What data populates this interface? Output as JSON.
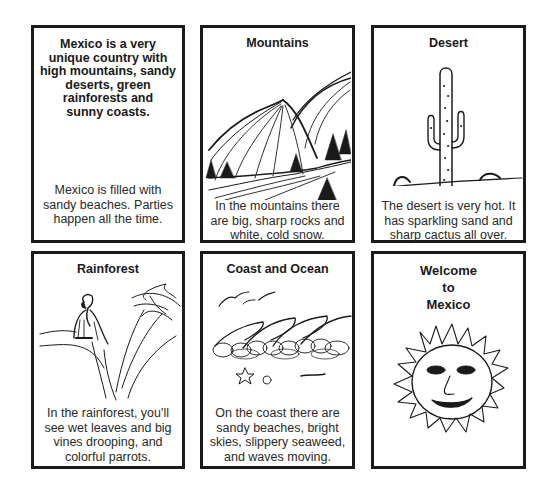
{
  "cards": [
    {
      "title": "Mexico is a very unique country with high mountains, sandy deserts, green rainforests and sunny coasts.",
      "title_lines": [
        "Mexico is a very",
        "unique country with",
        "high mountains, sandy",
        "deserts, green",
        "rainforests and",
        "sunny coasts."
      ],
      "text_lines": [
        "Mexico is filled with",
        "sandy beaches. Parties",
        "happen all the time."
      ],
      "illustration": "none"
    },
    {
      "title": "Mountains",
      "text_lines": [
        "In the mountains there",
        "are big, sharp rocks and",
        "white, cold snow."
      ],
      "illustration": "mountains-with-pine-trees"
    },
    {
      "title": "Desert",
      "text_lines": [
        "The desert is very hot. It",
        "has sparkling sand and",
        "sharp cactus all over."
      ],
      "illustration": "saguaro-cactus"
    },
    {
      "title": "Rainforest",
      "text_lines": [
        "In the rainforest, you'll",
        "see wet leaves and big",
        "vines drooping, and",
        "colorful parrots."
      ],
      "illustration": "parrot-on-branch"
    },
    {
      "title": "Coast and Ocean",
      "text_lines": [
        "On the coast there are",
        "sandy beaches, bright",
        "skies, slippery seaweed,",
        "and waves moving."
      ],
      "illustration": "waves-and-birds"
    },
    {
      "title": "Welcome to Mexico",
      "title_lines": [
        "Welcome",
        "to",
        "Mexico"
      ],
      "illustration": "smiling-sun"
    }
  ]
}
